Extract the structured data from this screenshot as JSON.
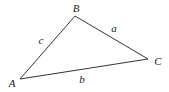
{
  "diagram": {
    "type": "triangle",
    "stroke_color": "#333333",
    "text_color": "#222222",
    "vertices": [
      {
        "label": "A",
        "x": 20,
        "y": 79,
        "label_x": 12,
        "label_y": 87
      },
      {
        "label": "B",
        "x": 75,
        "y": 16,
        "label_x": 76,
        "label_y": 12
      },
      {
        "label": "C",
        "x": 148,
        "y": 59,
        "label_x": 158,
        "label_y": 65
      }
    ],
    "sides": [
      {
        "label": "c",
        "from": "A",
        "to": "B",
        "label_x": 41,
        "label_y": 44
      },
      {
        "label": "a",
        "from": "B",
        "to": "C",
        "label_x": 114,
        "label_y": 32
      },
      {
        "label": "b",
        "from": "A",
        "to": "C",
        "label_x": 82,
        "label_y": 83
      }
    ]
  }
}
